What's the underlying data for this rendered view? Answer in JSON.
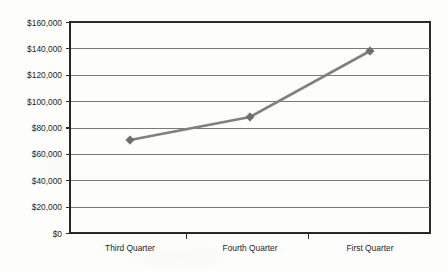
{
  "chart_data": {
    "type": "line",
    "title": "",
    "subtitle": "",
    "xlabel": "",
    "ylabel": "",
    "categories": [
      "Third Quarter",
      "Fourth Quarter",
      "First Quarter"
    ],
    "series": [
      {
        "name": "Sales",
        "values": [
          70500,
          88000,
          138000
        ],
        "color": "#808080",
        "marker": "diamond",
        "marker_color": "#6e6e6e"
      }
    ],
    "ylim": [
      0,
      160000
    ],
    "ytick_step": 20000,
    "ytick_labels": [
      "$160,000",
      "$140,000",
      "$120,000",
      "$100,000",
      "$80,000",
      "$60,000",
      "$40,000",
      "$20,000",
      "$0"
    ],
    "ytick_values": [
      160000,
      140000,
      120000,
      100000,
      80000,
      60000,
      40000,
      20000,
      0
    ],
    "grid": {
      "horizontal": true,
      "vertical": false,
      "color": "#6a6a6a"
    },
    "legend": {
      "visible": false,
      "position": "none",
      "entries": [
        "Sales"
      ]
    },
    "plot_area": {
      "left": 70,
      "top": 22,
      "right": 430,
      "bottom": 233,
      "background": "#fdfdfc",
      "border_color": "#2b2b2b"
    },
    "x_axis": {
      "category_ticks_between": true,
      "tick_positions": [
        186,
        308
      ]
    }
  }
}
